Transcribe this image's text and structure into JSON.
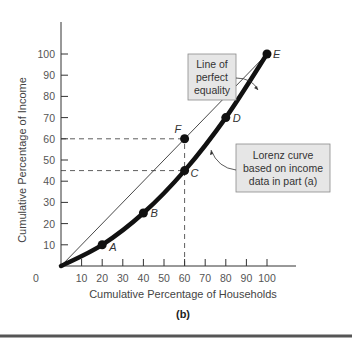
{
  "chart_data": {
    "type": "line",
    "title": "",
    "panel_label": "(b)",
    "xlabel": "Cumulative Percentage of Households",
    "ylabel": "Cumulative Percentage of Income",
    "xlim": [
      0,
      100
    ],
    "ylim": [
      0,
      100
    ],
    "x_ticks": [
      10,
      20,
      30,
      40,
      50,
      60,
      70,
      80,
      90,
      100
    ],
    "y_ticks": [
      10,
      20,
      30,
      40,
      50,
      60,
      70,
      80,
      90,
      100
    ],
    "origin_label": "0",
    "grid": false,
    "legend": null,
    "series": [
      {
        "name": "Line of perfect equality",
        "style": "thin",
        "x": [
          0,
          100
        ],
        "y": [
          0,
          100
        ]
      },
      {
        "name": "Lorenz curve based on income data in part (a)",
        "style": "thick",
        "x": [
          0,
          20,
          40,
          60,
          80,
          100
        ],
        "y": [
          0,
          10,
          25,
          45,
          70,
          100
        ]
      }
    ],
    "points": [
      {
        "label": "A",
        "x": 20,
        "y": 10
      },
      {
        "label": "B",
        "x": 40,
        "y": 25
      },
      {
        "label": "C",
        "x": 60,
        "y": 45
      },
      {
        "label": "D",
        "x": 80,
        "y": 70
      },
      {
        "label": "E",
        "x": 100,
        "y": 100
      },
      {
        "label": "F",
        "x": 60,
        "y": 60
      }
    ],
    "reference_lines": [
      {
        "orientation": "horizontal",
        "y": 60,
        "x_from": 0,
        "x_to": 60,
        "style": "dashed"
      },
      {
        "orientation": "horizontal",
        "y": 45,
        "x_from": 0,
        "x_to": 60,
        "style": "dashed"
      },
      {
        "orientation": "vertical",
        "x": 60,
        "y_from": 0,
        "y_to": 60,
        "style": "dashed"
      }
    ],
    "annotations": [
      {
        "id": "equality_callout",
        "lines": [
          "Line of",
          "perfect",
          "equality"
        ]
      },
      {
        "id": "lorenz_callout",
        "lines": [
          "Lorenz curve",
          "based on income",
          "data in part (a)"
        ]
      }
    ]
  },
  "colors": {
    "axis": "#333333",
    "curve": "#111111",
    "callout_fill": "#e6e6e6",
    "callout_border": "#8a8a8a",
    "rule": "#555555"
  }
}
